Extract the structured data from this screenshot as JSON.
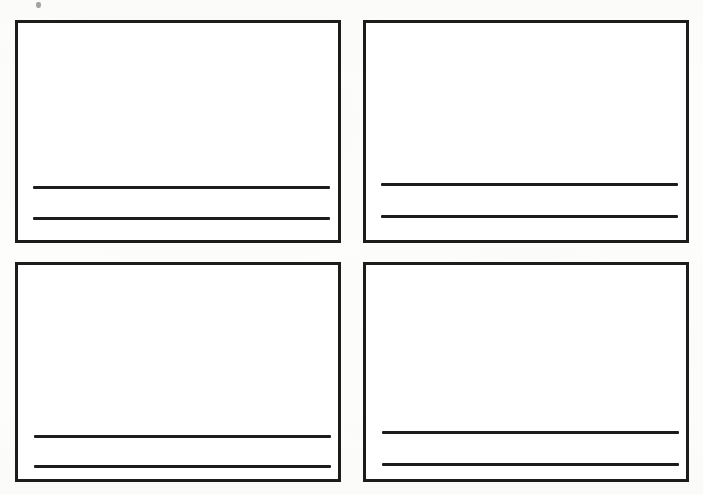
{
  "document": {
    "kind": "scanned-worksheet-page",
    "background_color": "#fdfdfc",
    "ink_color": "#1c1c1c",
    "page_width": 703,
    "page_height": 494,
    "caption": "",
    "artifacts": [
      {
        "name": "toner-speck",
        "x": 36,
        "y": 2,
        "width": 5,
        "height": 6
      }
    ]
  },
  "grid": {
    "columns": 2,
    "rows": 2,
    "total_frames": 4
  },
  "frames": [
    {
      "id": "frame-top-left",
      "label": "",
      "position": "top-left",
      "x": 15,
      "y": 20,
      "width": 326,
      "height": 223,
      "border_width": 3,
      "content_text": "",
      "rules": [
        {
          "id": "rule-1",
          "x": 15,
          "y": 163,
          "width": 297,
          "height": 3,
          "text": ""
        },
        {
          "id": "rule-2",
          "x": 15,
          "y": 194,
          "width": 297,
          "height": 3,
          "text": ""
        }
      ]
    },
    {
      "id": "frame-top-right",
      "label": "",
      "position": "top-right",
      "x": 363,
      "y": 20,
      "width": 326,
      "height": 223,
      "border_width": 3,
      "content_text": "",
      "rules": [
        {
          "id": "rule-1",
          "x": 15,
          "y": 160,
          "width": 297,
          "height": 3,
          "text": ""
        },
        {
          "id": "rule-2",
          "x": 15,
          "y": 192,
          "width": 297,
          "height": 3,
          "text": ""
        }
      ]
    },
    {
      "id": "frame-bottom-left",
      "label": "",
      "position": "bottom-left",
      "x": 15,
      "y": 262,
      "width": 326,
      "height": 220,
      "border_width": 3,
      "content_text": "",
      "rules": [
        {
          "id": "rule-1",
          "x": 16,
          "y": 170,
          "width": 297,
          "height": 3,
          "text": ""
        },
        {
          "id": "rule-2",
          "x": 16,
          "y": 200,
          "width": 297,
          "height": 3,
          "text": ""
        }
      ]
    },
    {
      "id": "frame-bottom-right",
      "label": "",
      "position": "bottom-right",
      "x": 363,
      "y": 262,
      "width": 326,
      "height": 220,
      "border_width": 3,
      "content_text": "",
      "rules": [
        {
          "id": "rule-1",
          "x": 16,
          "y": 166,
          "width": 297,
          "height": 3,
          "text": ""
        },
        {
          "id": "rule-2",
          "x": 16,
          "y": 198,
          "width": 297,
          "height": 3,
          "text": ""
        }
      ]
    }
  ]
}
